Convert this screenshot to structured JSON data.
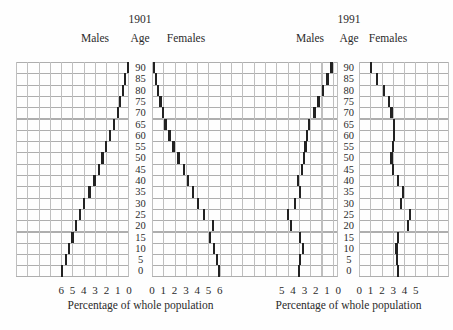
{
  "pyramids": [
    {
      "title": "1901",
      "males_header": "Males",
      "age_header": "Age",
      "females_header": "Females",
      "caption": "Percentage of whole population"
    },
    {
      "title": "1991",
      "males_header": "Males",
      "age_header": "Age",
      "females_header": "Females",
      "caption": "Percentage of whole population"
    }
  ],
  "chart_data": [
    {
      "type": "bar",
      "subtype": "population-pyramid",
      "title": "1901",
      "xlabel": "Percentage of whole population",
      "ylabel": "Age",
      "grid": true,
      "ages": [
        90,
        85,
        80,
        75,
        70,
        65,
        60,
        55,
        50,
        45,
        40,
        35,
        30,
        25,
        20,
        15,
        10,
        5,
        0
      ],
      "x_ticks_males": [
        6,
        5,
        4,
        3,
        2,
        1,
        0
      ],
      "x_ticks_females": [
        0,
        1,
        2,
        3,
        4,
        5,
        6
      ],
      "x_max": 6,
      "series": [
        {
          "name": "Males",
          "values": [
            0.1,
            0.35,
            0.55,
            0.8,
            1.0,
            1.3,
            1.65,
            2.0,
            2.35,
            2.65,
            3.05,
            3.5,
            3.95,
            4.3,
            4.7,
            5.0,
            5.3,
            5.6,
            5.95
          ]
        },
        {
          "name": "Females",
          "values": [
            0.15,
            0.35,
            0.55,
            0.75,
            0.95,
            1.2,
            1.55,
            1.9,
            2.35,
            2.8,
            3.2,
            3.65,
            4.1,
            4.6,
            5.4,
            5.15,
            5.5,
            5.75,
            5.95
          ]
        }
      ]
    },
    {
      "type": "bar",
      "subtype": "population-pyramid",
      "title": "1991",
      "xlabel": "Percentage of whole population",
      "ylabel": "Age",
      "grid": true,
      "ages": [
        90,
        85,
        80,
        75,
        70,
        65,
        60,
        55,
        50,
        45,
        40,
        35,
        30,
        25,
        20,
        15,
        10,
        5,
        0
      ],
      "x_ticks_males": [
        5,
        4,
        3,
        2,
        1,
        0
      ],
      "x_ticks_females": [
        0,
        1,
        2,
        3,
        4,
        5
      ],
      "x_max": 5,
      "series": [
        {
          "name": "Males",
          "values": [
            0.6,
            0.95,
            1.35,
            1.75,
            2.1,
            2.6,
            2.8,
            2.9,
            3.0,
            3.2,
            3.6,
            3.4,
            3.8,
            4.45,
            4.2,
            3.4,
            3.15,
            3.4,
            3.45
          ]
        },
        {
          "name": "Females",
          "values": [
            1.05,
            1.6,
            2.2,
            2.65,
            2.85,
            3.05,
            3.1,
            2.95,
            2.85,
            3.0,
            3.45,
            3.85,
            3.7,
            4.5,
            4.3,
            3.45,
            3.3,
            3.35,
            3.45
          ]
        }
      ]
    }
  ]
}
